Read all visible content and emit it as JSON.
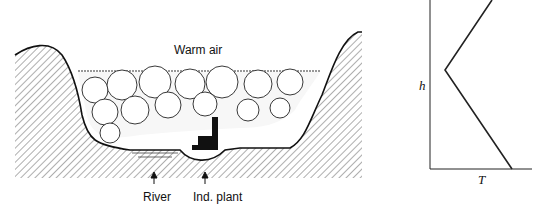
{
  "valley_diagram": {
    "top_label": "Warm air",
    "labels": [
      {
        "id": "river",
        "text": "River"
      },
      {
        "id": "plant",
        "text": "Ind. plant"
      }
    ]
  },
  "profile_chart": {
    "y_axis_label": "h",
    "x_axis_label": "T"
  }
}
